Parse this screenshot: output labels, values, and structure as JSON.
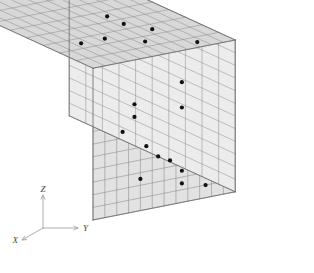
{
  "figure": {
    "background_color": "#ffffff",
    "cube": {
      "nx": 10,
      "ny": 12,
      "nz": 12,
      "face_top_color": "#d8d8d8",
      "face_front_color": "#e2e2e2",
      "face_right_color": "#ececec",
      "edge_color": "#8a8a8a",
      "outline_color": "#6e6e6e",
      "marker_color": "#111111",
      "marker_radius": 2.1
    },
    "projection": {
      "origin_x": 93,
      "origin_y": 220,
      "ex": [
        -16.6,
        -7.6
      ],
      "ey": [
        11.85,
        -2.35
      ],
      "ez": [
        0,
        -12.65
      ],
      "note": "screen vectors per unit cell along X, Y, Z"
    },
    "axes_indicator": {
      "origin": [
        43,
        228
      ],
      "labels": {
        "x": "X",
        "y": "Y",
        "z": "Z"
      },
      "x_tip": [
        22,
        240
      ],
      "y_tip": [
        78,
        228
      ],
      "z_tip": [
        43,
        195
      ],
      "line_color": "#9a9a9a",
      "label_color": "#444444"
    },
    "markers_front": [
      {
        "col": 3.5,
        "row": 3.5
      },
      {
        "col": 3.5,
        "row": 4.5
      },
      {
        "col": 2.5,
        "row": 5.5
      },
      {
        "col": 4.5,
        "row": 7.0
      },
      {
        "col": 5.5,
        "row": 8.0
      },
      {
        "col": 6.5,
        "row": 8.5
      },
      {
        "col": 4.0,
        "row": 9.5
      },
      {
        "col": 7.5,
        "row": 2.5
      },
      {
        "col": 7.5,
        "row": 4.5
      },
      {
        "col": 7.5,
        "row": 9.5
      },
      {
        "col": 7.5,
        "row": 10.5
      },
      {
        "col": 9.5,
        "row": 11.0
      }
    ],
    "markers_top": [
      {
        "u": 2.5,
        "v": 2.5
      },
      {
        "u": 4.5,
        "v": 2.5
      },
      {
        "u": 6.5,
        "v": 1.5
      },
      {
        "u": 8.5,
        "v": 2.5
      },
      {
        "u": 9.5,
        "v": 0.5
      },
      {
        "u": 7.5,
        "v": 3.5
      },
      {
        "u": 7.5,
        "v": 4.5
      }
    ]
  }
}
